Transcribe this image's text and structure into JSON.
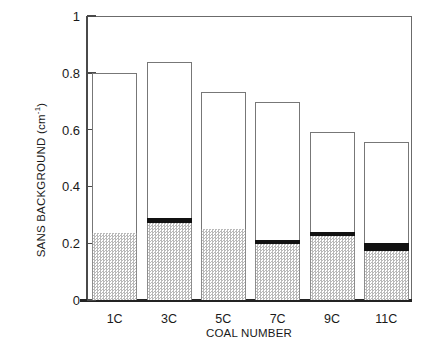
{
  "chart_data": {
    "type": "bar",
    "title": "",
    "subtitle": "",
    "xlabel": "COAL NUMBER",
    "ylabel": "SANS BACKGROUND (cm",
    "ylabel_exponent": "-1",
    "ylabel_suffix": ")",
    "categories": [
      "1C",
      "3C",
      "5C",
      "7C",
      "9C",
      "11C"
    ],
    "ylim": [
      0,
      1
    ],
    "ytick_values": [
      0,
      0.2,
      0.4,
      0.6,
      0.8,
      1
    ],
    "ytick_labels": [
      "0",
      "0.2",
      "0.4",
      "0.6",
      "0.8",
      "1"
    ],
    "grid": false,
    "legend": "none",
    "stacked": true,
    "series": [
      {
        "name": "hatched-lower",
        "style": "gray-stipple",
        "color": "#b9b9b9",
        "values": [
          0.235,
          0.27,
          0.25,
          0.197,
          0.225,
          0.172
        ]
      },
      {
        "name": "black-band",
        "style": "solid-black",
        "color": "#111111",
        "values": [
          0.0,
          0.019,
          0.0,
          0.014,
          0.014,
          0.028
        ]
      },
      {
        "name": "open-upper",
        "style": "white-outline",
        "color": "#ffffff",
        "values": [
          0.565,
          0.549,
          0.482,
          0.486,
          0.353,
          0.356
        ]
      }
    ],
    "totals": [
      0.8,
      0.838,
      0.732,
      0.697,
      0.592,
      0.556
    ]
  },
  "axes": {
    "y_title_text": "SANS BACKGROUND (cm",
    "y_title_sup": "-1",
    "y_title_close": ")",
    "x_title_text": "COAL NUMBER"
  }
}
